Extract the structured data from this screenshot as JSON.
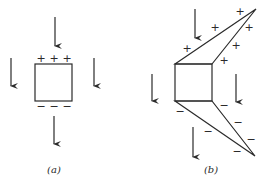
{
  "panels": [
    {
      "id": "a",
      "label": "(a)",
      "label_pos": [
        54,
        173
      ],
      "square": {
        "x": 35,
        "y": 64,
        "w": 37,
        "h": 37
      },
      "arrows": [
        {
          "x": 55,
          "y1": 17,
          "y2": 46
        },
        {
          "x": 11,
          "y1": 58,
          "y2": 86
        },
        {
          "x": 94,
          "y1": 58,
          "y2": 86
        },
        {
          "x": 54,
          "y1": 116,
          "y2": 144
        }
      ],
      "plus_signs": [
        [
          41,
          59
        ],
        [
          54,
          59
        ],
        [
          67,
          59
        ]
      ],
      "minus_signs": [
        [
          41,
          107
        ],
        [
          54,
          107
        ],
        [
          67,
          107
        ]
      ],
      "polygons": []
    },
    {
      "id": "b",
      "label": "(b)",
      "label_pos": [
        211,
        173
      ],
      "square": {
        "x": 175,
        "y": 64,
        "w": 37,
        "h": 37
      },
      "arrows": [
        {
          "x": 195,
          "y1": 9,
          "y2": 38
        },
        {
          "x": 152,
          "y1": 74,
          "y2": 101
        },
        {
          "x": 236,
          "y1": 74,
          "y2": 102
        },
        {
          "x": 193,
          "y1": 127,
          "y2": 157
        }
      ],
      "plus_signs": [
        [
          240,
          12
        ],
        [
          215,
          28
        ],
        [
          249,
          28
        ],
        [
          187,
          49
        ],
        [
          236,
          46
        ],
        [
          224,
          61
        ]
      ],
      "minus_signs": [
        [
          180,
          112
        ],
        [
          224,
          106
        ],
        [
          208,
          132
        ],
        [
          238,
          123
        ],
        [
          251,
          140
        ],
        [
          237,
          152
        ]
      ],
      "polygons": [
        {
          "name": "upper-plus-lobe",
          "points": "175,64 256,9 212,64"
        },
        {
          "name": "lower-minus-lobe",
          "points": "175,101 255,156 212,101"
        }
      ]
    }
  ],
  "signs": {
    "plus": "+",
    "minus": "−"
  }
}
